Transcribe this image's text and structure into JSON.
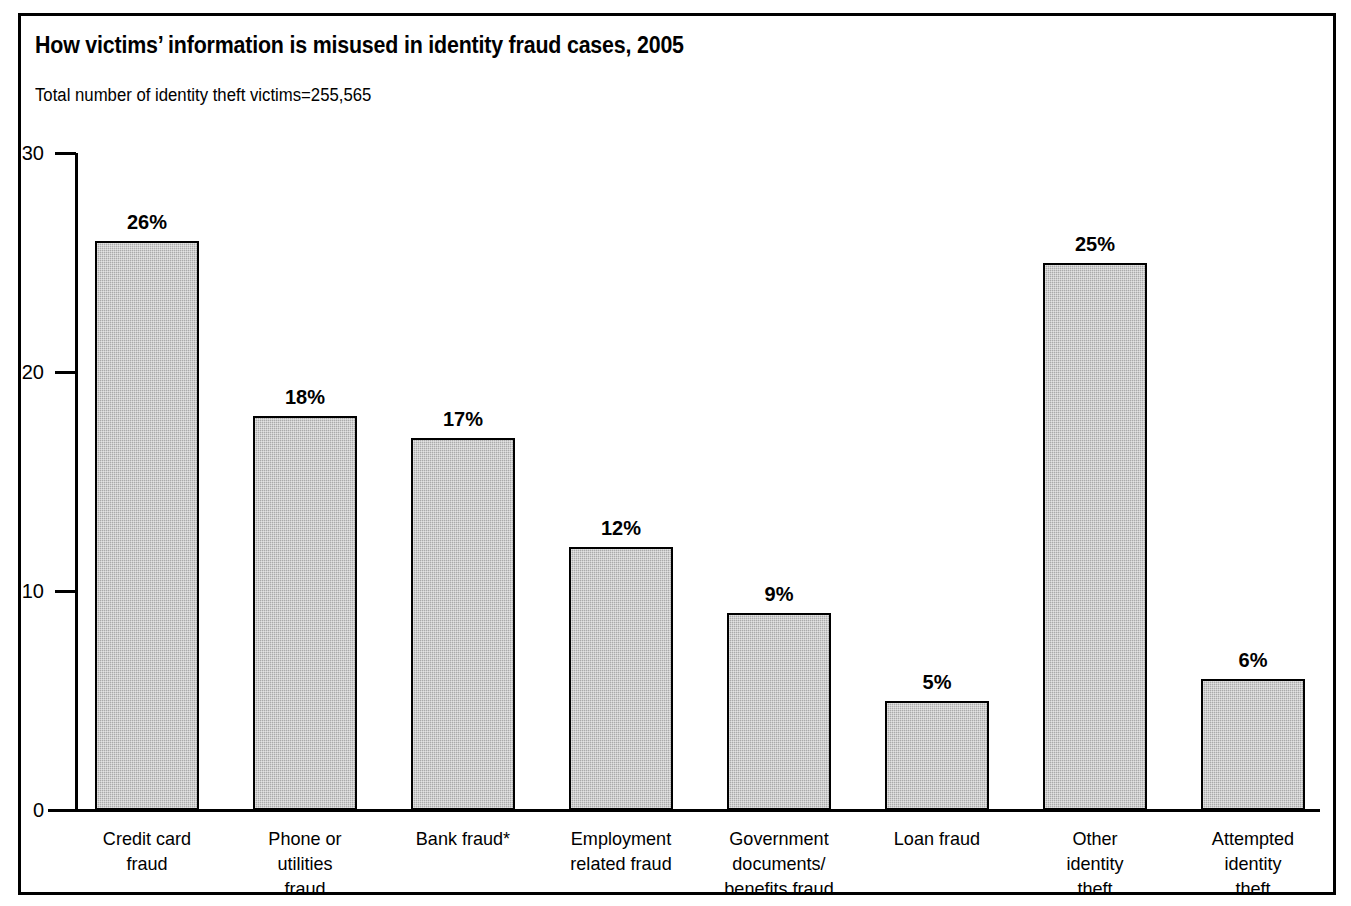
{
  "header": {
    "title": "How victims’ information is misused  in identity fraud cases, 2005",
    "subtitle": "Total number of identity theft victims=255,565"
  },
  "chart_data": {
    "type": "bar",
    "title": "How victims’ information is misused  in identity fraud cases, 2005",
    "subtitle": "Total number of identity theft victims=255,565",
    "xlabel": "",
    "ylabel": "",
    "ylim": [
      0,
      30
    ],
    "yticks": [
      0,
      10,
      20,
      30
    ],
    "ytick_labels": [
      "0",
      "10",
      "20",
      "30"
    ],
    "grid": false,
    "legend": false,
    "bar_color": "#aaaaaa",
    "bar_edge_color": "#000000",
    "value_suffix": "%",
    "categories": [
      "Credit card fraud",
      "Phone or utilities fraud",
      "Bank fraud*",
      "Employment related fraud",
      "Government documents/ benefits fraud",
      "Loan fraud",
      "Other identity theft",
      "Attempted identity theft"
    ],
    "category_lines": [
      [
        "Credit card",
        "fraud"
      ],
      [
        "Phone or",
        "utilities",
        "fraud"
      ],
      [
        "Bank fraud*"
      ],
      [
        "Employment",
        "related fraud"
      ],
      [
        "Government",
        "documents/",
        "benefits fraud"
      ],
      [
        "Loan fraud"
      ],
      [
        "Other",
        "identity",
        "theft"
      ],
      [
        "Attempted",
        "identity",
        "theft"
      ]
    ],
    "values": [
      26,
      18,
      17,
      12,
      9,
      5,
      25,
      6
    ],
    "value_labels": [
      "26%",
      "18%",
      "17%",
      "12%",
      "9%",
      "5%",
      "25%",
      "6%"
    ]
  }
}
